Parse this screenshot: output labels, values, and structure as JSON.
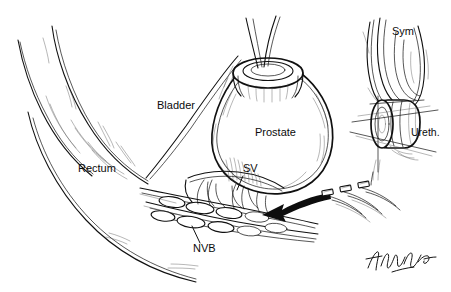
{
  "figure": {
    "medium": "pen-and-ink line drawing",
    "background_color": "#ffffff",
    "ink_color": "#101010",
    "width": 451,
    "height": 292
  },
  "labels": {
    "bladder": {
      "text": "Bladder",
      "x": 157,
      "y": 106
    },
    "prostate": {
      "text": "Prostate",
      "x": 255,
      "y": 133
    },
    "rectum": {
      "text": "Rectum",
      "x": 78,
      "y": 169
    },
    "sv": {
      "text": "SV",
      "x": 243,
      "y": 169
    },
    "nvb": {
      "text": "NVB",
      "x": 193,
      "y": 249
    },
    "sym": {
      "text": "Sym",
      "x": 392,
      "y": 32
    },
    "ureth": {
      "text": "Ureth.",
      "x": 411,
      "y": 133
    }
  },
  "annotations": {
    "arrow": {
      "name": "retraction-arrow",
      "description": "solid black arrow pointing left toward the prostate apex",
      "color": "#0d0d0d"
    },
    "suture_tags": {
      "count": 3,
      "description": "small rectangular suture tags on curved threads at right"
    },
    "signature": {
      "present": true,
      "description": "cursive artist signature, lower right"
    }
  },
  "structures": [
    {
      "name": "bladder",
      "label": "Bladder"
    },
    {
      "name": "prostate",
      "label": "Prostate"
    },
    {
      "name": "rectum",
      "label": "Rectum"
    },
    {
      "name": "seminal-vesicle",
      "label": "SV"
    },
    {
      "name": "neurovascular-bundle",
      "label": "NVB"
    },
    {
      "name": "pubic-symphysis",
      "label": "Sym"
    },
    {
      "name": "urethral-stump",
      "label": "Ureth."
    }
  ]
}
